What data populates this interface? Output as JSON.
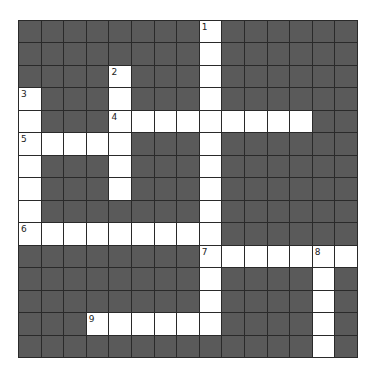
{
  "puzzle": {
    "rows": 15,
    "cols": 15,
    "colors": {
      "block": "#5a5a5a",
      "open": "#ffffff",
      "grid_line": "#2a2a2a",
      "number": "#222222"
    },
    "entries": [
      {
        "number": "1",
        "direction": "down",
        "row": 0,
        "col": 8,
        "length": 14
      },
      {
        "number": "2",
        "direction": "down",
        "row": 2,
        "col": 4,
        "length": 6
      },
      {
        "number": "3",
        "direction": "down",
        "row": 3,
        "col": 0,
        "length": 7
      },
      {
        "number": "4",
        "direction": "across",
        "row": 4,
        "col": 4,
        "length": 9
      },
      {
        "number": "5",
        "direction": "across",
        "row": 5,
        "col": 0,
        "length": 5
      },
      {
        "number": "6",
        "direction": "across",
        "row": 9,
        "col": 0,
        "length": 9
      },
      {
        "number": "7",
        "direction": "across",
        "row": 10,
        "col": 8,
        "length": 7
      },
      {
        "number": "8",
        "direction": "down",
        "row": 10,
        "col": 13,
        "length": 5
      },
      {
        "number": "9",
        "direction": "across",
        "row": 13,
        "col": 3,
        "length": 6
      }
    ]
  }
}
